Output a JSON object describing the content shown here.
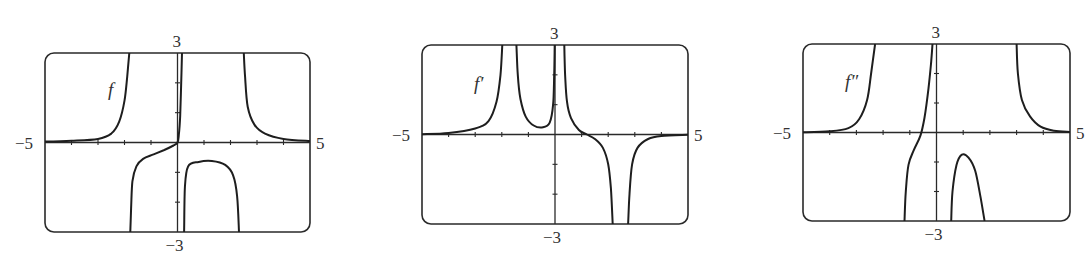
{
  "chart_data": [
    {
      "type": "line",
      "title": "f",
      "function_label": "f",
      "xlim": [
        -5,
        5
      ],
      "ylim": [
        -3,
        3
      ],
      "x_tick_labels": {
        "min": "−5",
        "max": "5"
      },
      "y_tick_labels": {
        "max": "3",
        "min": "−3"
      },
      "x_ticks": [
        -4,
        -3,
        -2,
        -1,
        1,
        2,
        3,
        4
      ],
      "y_ticks": [
        -2,
        -1,
        1,
        2
      ],
      "grid": false,
      "box": {
        "left": 45,
        "top": 53,
        "right": 310,
        "bottom": 232
      },
      "label_pos": {
        "x": 108,
        "y": 80
      },
      "vertical_asymptotes": [
        -1.8,
        0.2,
        2.55
      ],
      "series": [
        {
          "name": "f branch 1",
          "points": [
            [
              -5,
              0.03
            ],
            [
              -4,
              0.06
            ],
            [
              -3,
              0.12
            ],
            [
              -2.5,
              0.3
            ],
            [
              -2.2,
              0.7
            ],
            [
              -2.0,
              1.4
            ],
            [
              -1.9,
              2.2
            ],
            [
              -1.82,
              3
            ]
          ]
        },
        {
          "name": "f branch 2",
          "points": [
            [
              -1.78,
              -3
            ],
            [
              -1.75,
              -2.2
            ],
            [
              -1.7,
              -1.3
            ],
            [
              -1.55,
              -0.8
            ],
            [
              -1.3,
              -0.55
            ],
            [
              -0.9,
              -0.4
            ],
            [
              -0.5,
              -0.25
            ],
            [
              -0.15,
              -0.1
            ],
            [
              0,
              0
            ],
            [
              0.05,
              0.25
            ],
            [
              0.1,
              0.9
            ],
            [
              0.14,
              2
            ],
            [
              0.17,
              3
            ]
          ]
        },
        {
          "name": "f branch 3",
          "points": [
            [
              0.25,
              -3
            ],
            [
              0.28,
              -1.5
            ],
            [
              0.4,
              -0.8
            ],
            [
              0.8,
              -0.65
            ],
            [
              1.3,
              -0.62
            ],
            [
              1.8,
              -0.75
            ],
            [
              2.1,
              -1.1
            ],
            [
              2.25,
              -1.8
            ],
            [
              2.32,
              -3
            ]
          ]
        },
        {
          "name": "f branch 4",
          "points": [
            [
              2.5,
              3
            ],
            [
              2.55,
              2.2
            ],
            [
              2.65,
              1.2
            ],
            [
              2.9,
              0.6
            ],
            [
              3.3,
              0.3
            ],
            [
              4,
              0.12
            ],
            [
              5,
              0.05
            ]
          ]
        }
      ]
    },
    {
      "type": "line",
      "title": "f′",
      "function_label": "f′",
      "xlim": [
        -5,
        5
      ],
      "ylim": [
        -3,
        3
      ],
      "x_tick_labels": {
        "min": "−5",
        "max": "5"
      },
      "y_tick_labels": {
        "max": "3",
        "min": "−3"
      },
      "x_ticks": [
        -4,
        -3,
        -2,
        -1,
        1,
        2,
        3,
        4
      ],
      "y_ticks": [
        -2,
        -1,
        1,
        2
      ],
      "grid": false,
      "box": {
        "left": 422,
        "top": 45,
        "right": 688,
        "bottom": 224
      },
      "label_pos": {
        "x": 474,
        "y": 74
      },
      "vertical_asymptotes": [
        -1.9,
        0.2,
        2.8
      ],
      "series": [
        {
          "name": "f' branch 1",
          "points": [
            [
              -5,
              0.01
            ],
            [
              -4,
              0.05
            ],
            [
              -3,
              0.2
            ],
            [
              -2.5,
              0.45
            ],
            [
              -2.2,
              1.1
            ],
            [
              -2.05,
              2
            ],
            [
              -1.98,
              3
            ]
          ]
        },
        {
          "name": "f' branch 2",
          "points": [
            [
              -1.45,
              3
            ],
            [
              -1.4,
              2
            ],
            [
              -1.3,
              1.2
            ],
            [
              -1.1,
              0.6
            ],
            [
              -0.8,
              0.3
            ],
            [
              -0.45,
              0.24
            ],
            [
              -0.2,
              0.4
            ],
            [
              -0.07,
              1
            ],
            [
              -0.03,
              2
            ],
            [
              -0.01,
              3
            ]
          ]
        },
        {
          "name": "f' branch 3",
          "points": [
            [
              0.35,
              3
            ],
            [
              0.38,
              2
            ],
            [
              0.45,
              1.1
            ],
            [
              0.6,
              0.55
            ],
            [
              0.9,
              0.15
            ],
            [
              1.2,
              0
            ],
            [
              1.5,
              -0.15
            ],
            [
              1.8,
              -0.45
            ],
            [
              2.0,
              -1
            ],
            [
              2.1,
              -1.8
            ],
            [
              2.17,
              -3
            ]
          ]
        },
        {
          "name": "f' branch 4",
          "points": [
            [
              2.75,
              -3
            ],
            [
              2.8,
              -2
            ],
            [
              2.9,
              -1
            ],
            [
              3.1,
              -0.45
            ],
            [
              3.5,
              -0.15
            ],
            [
              4,
              -0.05
            ],
            [
              5,
              -0.01
            ]
          ]
        }
      ]
    },
    {
      "type": "line",
      "title": "f″",
      "function_label": "f″",
      "xlim": [
        -5,
        5
      ],
      "ylim": [
        -3,
        3
      ],
      "x_tick_labels": {
        "min": "−5",
        "max": "5"
      },
      "y_tick_labels": {
        "max": "3",
        "min": "−3"
      },
      "x_ticks": [
        -4,
        -3,
        -2,
        -1,
        1,
        2,
        3,
        4
      ],
      "y_ticks": [
        -2,
        -1,
        1,
        2
      ],
      "grid": false,
      "box": {
        "left": 803,
        "top": 44,
        "right": 1070,
        "bottom": 221
      },
      "label_pos": {
        "x": 845,
        "y": 72
      },
      "vertical_asymptotes": [
        -2.3,
        -0.1,
        2.5
      ],
      "series": [
        {
          "name": "f'' branch 1",
          "points": [
            [
              -5,
              0.01
            ],
            [
              -4,
              0.04
            ],
            [
              -3.3,
              0.15
            ],
            [
              -2.9,
              0.45
            ],
            [
              -2.6,
              1.1
            ],
            [
              -2.45,
              2
            ],
            [
              -2.3,
              3
            ]
          ]
        },
        {
          "name": "f'' branch 2",
          "points": [
            [
              -1.2,
              -3
            ],
            [
              -1.15,
              -2
            ],
            [
              -1.05,
              -1.1
            ],
            [
              -0.85,
              -0.6
            ],
            [
              -0.6,
              -0.1
            ],
            [
              -0.45,
              0.5
            ],
            [
              -0.3,
              1.5
            ],
            [
              -0.2,
              2.4
            ],
            [
              -0.15,
              3
            ]
          ]
        },
        {
          "name": "f'' branch 3",
          "points": [
            [
              0.55,
              -3
            ],
            [
              0.6,
              -2
            ],
            [
              0.75,
              -1.1
            ],
            [
              0.95,
              -0.75
            ],
            [
              1.2,
              -0.85
            ],
            [
              1.45,
              -1.3
            ],
            [
              1.65,
              -2.2
            ],
            [
              1.8,
              -3
            ]
          ]
        },
        {
          "name": "f'' branch 4",
          "points": [
            [
              3,
              3
            ],
            [
              3.05,
              2
            ],
            [
              3.2,
              1.1
            ],
            [
              3.5,
              0.55
            ],
            [
              3.9,
              0.2
            ],
            [
              4.4,
              0.06
            ],
            [
              5,
              0.02
            ]
          ]
        }
      ]
    }
  ]
}
